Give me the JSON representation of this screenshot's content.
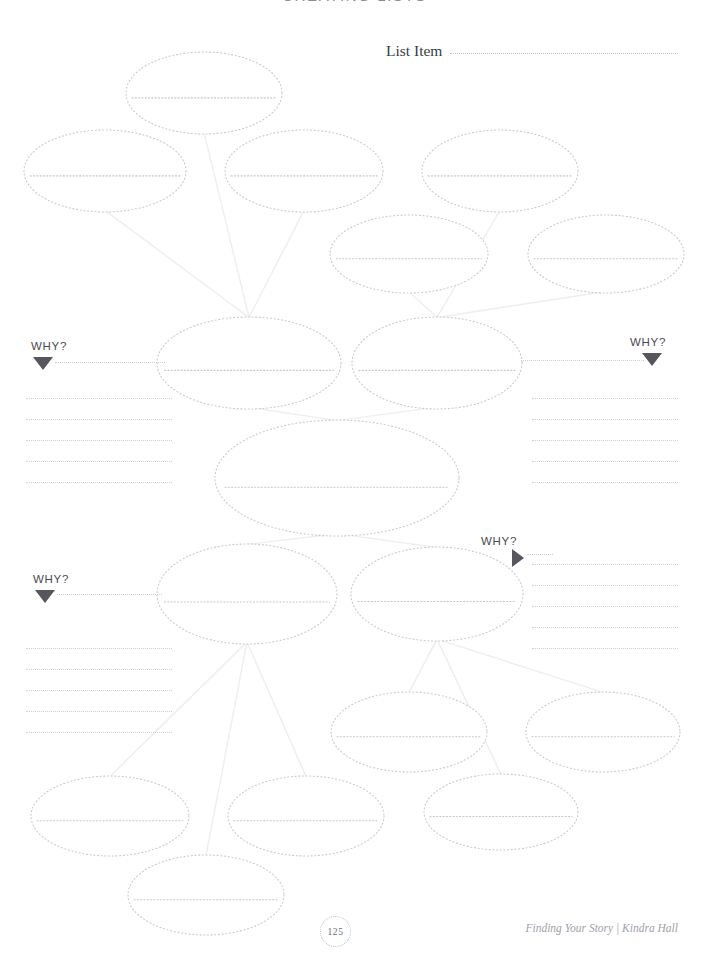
{
  "worksheet": {
    "title": "CREATING LISTS",
    "list_item_label": "List Item"
  },
  "why_markers": [
    {
      "id": "why-top-left",
      "label": "WHY?",
      "arrow": "triangle-down",
      "side": "left"
    },
    {
      "id": "why-top-right",
      "label": "WHY?",
      "arrow": "triangle-down",
      "side": "right"
    },
    {
      "id": "why-mid-right",
      "label": "WHY?",
      "arrow": "triangle-right",
      "side": "right"
    },
    {
      "id": "why-bottom-left",
      "label": "WHY?",
      "arrow": "triangle-down",
      "side": "left"
    }
  ],
  "write_blocks": [
    {
      "id": "notes-top-left",
      "lines": 5
    },
    {
      "id": "notes-top-right",
      "lines": 5
    },
    {
      "id": "notes-bottom-left",
      "lines": 5
    },
    {
      "id": "notes-bottom-right",
      "lines": 5
    }
  ],
  "bubbles": [
    {
      "id": "bubble-1",
      "cx": 204,
      "cy": 93,
      "rx": 78,
      "ry": 41,
      "line_y_ratio": 0.56
    },
    {
      "id": "bubble-2",
      "cx": 105,
      "cy": 171,
      "rx": 81,
      "ry": 41,
      "line_y_ratio": 0.56
    },
    {
      "id": "bubble-3",
      "cx": 304,
      "cy": 171,
      "rx": 79,
      "ry": 41,
      "line_y_ratio": 0.56
    },
    {
      "id": "bubble-4",
      "cx": 500,
      "cy": 171,
      "rx": 78,
      "ry": 41,
      "line_y_ratio": 0.56
    },
    {
      "id": "bubble-5",
      "cx": 409,
      "cy": 254,
      "rx": 79,
      "ry": 39,
      "line_y_ratio": 0.56
    },
    {
      "id": "bubble-6",
      "cx": 606,
      "cy": 254,
      "rx": 78,
      "ry": 39,
      "line_y_ratio": 0.56
    },
    {
      "id": "bubble-7",
      "cx": 249,
      "cy": 363,
      "rx": 92,
      "ry": 46,
      "line_y_ratio": 0.58
    },
    {
      "id": "bubble-8",
      "cx": 437,
      "cy": 363,
      "rx": 85,
      "ry": 46,
      "line_y_ratio": 0.58
    },
    {
      "id": "bubble-9",
      "cx": 337,
      "cy": 478,
      "rx": 122,
      "ry": 58,
      "line_y_ratio": 0.58
    },
    {
      "id": "bubble-10",
      "cx": 247,
      "cy": 594,
      "rx": 90,
      "ry": 50,
      "line_y_ratio": 0.58
    },
    {
      "id": "bubble-11",
      "cx": 437,
      "cy": 594,
      "rx": 86,
      "ry": 47,
      "line_y_ratio": 0.58
    },
    {
      "id": "bubble-12",
      "cx": 409,
      "cy": 732,
      "rx": 78,
      "ry": 40,
      "line_y_ratio": 0.56
    },
    {
      "id": "bubble-13",
      "cx": 603,
      "cy": 732,
      "rx": 77,
      "ry": 40,
      "line_y_ratio": 0.56
    },
    {
      "id": "bubble-14",
      "cx": 110,
      "cy": 816,
      "rx": 79,
      "ry": 40,
      "line_y_ratio": 0.56
    },
    {
      "id": "bubble-15",
      "cx": 306,
      "cy": 816,
      "rx": 78,
      "ry": 40,
      "line_y_ratio": 0.56
    },
    {
      "id": "bubble-16",
      "cx": 501,
      "cy": 812,
      "rx": 77,
      "ry": 38,
      "line_y_ratio": 0.56
    },
    {
      "id": "bubble-17",
      "cx": 206,
      "cy": 895,
      "rx": 78,
      "ry": 40,
      "line_y_ratio": 0.56
    }
  ],
  "connectors": [
    {
      "from": "bubble-1",
      "to": "bubble-7"
    },
    {
      "from": "bubble-2",
      "to": "bubble-7"
    },
    {
      "from": "bubble-3",
      "to": "bubble-7"
    },
    {
      "from": "bubble-4",
      "to": "bubble-8"
    },
    {
      "from": "bubble-5",
      "to": "bubble-8"
    },
    {
      "from": "bubble-6",
      "to": "bubble-8"
    },
    {
      "from": "bubble-7",
      "to": "bubble-9"
    },
    {
      "from": "bubble-8",
      "to": "bubble-9"
    },
    {
      "from": "bubble-9",
      "to": "bubble-10"
    },
    {
      "from": "bubble-9",
      "to": "bubble-11"
    },
    {
      "from": "bubble-10",
      "to": "bubble-14"
    },
    {
      "from": "bubble-10",
      "to": "bubble-15"
    },
    {
      "from": "bubble-10",
      "to": "bubble-17"
    },
    {
      "from": "bubble-11",
      "to": "bubble-12"
    },
    {
      "from": "bubble-11",
      "to": "bubble-13"
    },
    {
      "from": "bubble-11",
      "to": "bubble-16"
    }
  ],
  "footer": {
    "page_number": "125",
    "credit": "Finding Your Story | Kindra Hall"
  },
  "colors": {
    "bubble_stroke": "#c9c9d2",
    "connector": "#eeeef1",
    "writing_line": "#cfcfd7",
    "arrow": "#56565e",
    "title_text": "#8c8c96"
  }
}
